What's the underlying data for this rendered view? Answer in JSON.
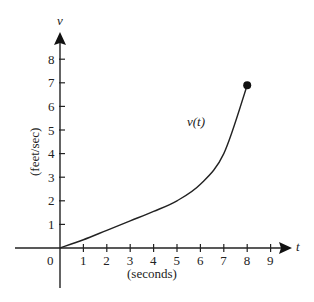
{
  "chart_data": {
    "type": "line",
    "title": "",
    "xlabel": "(seconds)",
    "ylabel": "(feet/sec)",
    "x_axis_var": "t",
    "y_axis_var": "v",
    "curve_label": "v(t)",
    "x_ticks": [
      "0",
      "1",
      "2",
      "3",
      "4",
      "5",
      "6",
      "7",
      "8",
      "9"
    ],
    "y_ticks": [
      "1",
      "2",
      "3",
      "4",
      "5",
      "6",
      "7",
      "8"
    ],
    "xlim": [
      -2.5,
      10
    ],
    "ylim": [
      -2.3,
      9.5
    ],
    "grid": false,
    "series": [
      {
        "name": "v(t)",
        "x": [
          0,
          1,
          2,
          3,
          4,
          5,
          6,
          7,
          8
        ],
        "y": [
          0,
          0.35,
          0.75,
          1.15,
          1.55,
          2.0,
          2.7,
          4.0,
          6.9
        ]
      }
    ],
    "endpoint": {
      "x": 8,
      "y": 6.9,
      "marker": "filled-circle"
    }
  }
}
